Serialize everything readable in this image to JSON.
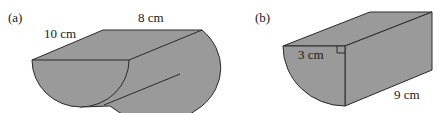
{
  "figures": [
    {
      "id": "a",
      "label": "(a)",
      "shape": "half-cylinder",
      "dimensions": [
        {
          "name": "diameter",
          "text": "10 cm"
        },
        {
          "name": "length",
          "text": "8 cm"
        }
      ]
    },
    {
      "id": "b",
      "label": "(b)",
      "shape": "quarter-cylinder",
      "dimensions": [
        {
          "name": "radius",
          "text": "3 cm"
        },
        {
          "name": "length",
          "text": "9 cm"
        }
      ],
      "right_angle_marker": true
    }
  ],
  "colors": {
    "fill": "#9a9a9a",
    "stroke": "#2a2a2a",
    "background": "#ffffff"
  }
}
